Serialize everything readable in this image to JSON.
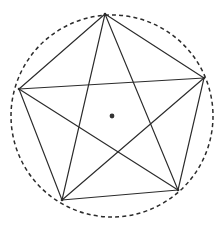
{
  "figure": {
    "background_color": "#ffffff",
    "canvas": {
      "width": 222,
      "height": 226
    }
  },
  "chart_data": {
    "type": "diagram",
    "xlabel": "",
    "ylabel": "",
    "grid": false,
    "legend": false,
    "xlim": [
      0,
      222
    ],
    "ylim": [
      0,
      226
    ],
    "circumcircle": {
      "label": "circumscribed circle",
      "cx": 112,
      "cy": 116,
      "r": 101,
      "style": "dashed",
      "dash_pattern": "4 3.2",
      "stroke": "#2b2b2b",
      "stroke_width": 1.5
    },
    "center_point": {
      "label": "center",
      "x": 112,
      "y": 116,
      "r": 2.4,
      "fill": "#333333"
    },
    "vertices": [
      {
        "name": "top",
        "x": 105,
        "y": 14
      },
      {
        "name": "right",
        "x": 204,
        "y": 78
      },
      {
        "name": "bottom-right",
        "x": 178,
        "y": 190
      },
      {
        "name": "bottom-left",
        "x": 62,
        "y": 200
      },
      {
        "name": "left",
        "x": 19,
        "y": 89
      }
    ],
    "edges": [
      {
        "name": "edge-top-right",
        "from": "top",
        "to": "right",
        "x1": 105,
        "y1": 14,
        "x2": 204,
        "y2": 78
      },
      {
        "name": "edge-right-bottomright",
        "from": "right",
        "to": "bottom-right",
        "x1": 204,
        "y1": 78,
        "x2": 178,
        "y2": 190
      },
      {
        "name": "edge-bottomright-bottomleft",
        "from": "bottom-right",
        "to": "bottom-left",
        "x1": 178,
        "y1": 190,
        "x2": 62,
        "y2": 200
      },
      {
        "name": "edge-bottomleft-left",
        "from": "bottom-left",
        "to": "left",
        "x1": 62,
        "y1": 200,
        "x2": 19,
        "y2": 89
      },
      {
        "name": "edge-left-top",
        "from": "left",
        "to": "top",
        "x1": 19,
        "y1": 89,
        "x2": 105,
        "y2": 14
      }
    ],
    "diagonals": [
      {
        "name": "diagonal-top-bottomright",
        "from": "top",
        "to": "bottom-right",
        "x1": 105,
        "y1": 14,
        "x2": 178,
        "y2": 190
      },
      {
        "name": "diagonal-top-bottomleft",
        "from": "top",
        "to": "bottom-left",
        "x1": 105,
        "y1": 14,
        "x2": 62,
        "y2": 200
      },
      {
        "name": "diagonal-right-bottomleft",
        "from": "right",
        "to": "bottom-left",
        "x1": 204,
        "y1": 78,
        "x2": 62,
        "y2": 200
      },
      {
        "name": "diagonal-right-left",
        "from": "right",
        "to": "left",
        "x1": 204,
        "y1": 78,
        "x2": 19,
        "y2": 89
      },
      {
        "name": "diagonal-bottomright-left",
        "from": "bottom-right",
        "to": "left",
        "x1": 178,
        "y1": 190,
        "x2": 19,
        "y2": 89
      }
    ],
    "line_style": {
      "stroke": "#2b2b2b",
      "stroke_width": 1.15
    }
  }
}
